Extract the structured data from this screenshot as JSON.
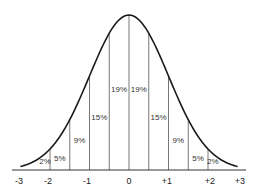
{
  "chart_data": {
    "type": "area",
    "title": "",
    "xlabel": "",
    "ylabel": "",
    "x_ticks": [
      "-3",
      "-2",
      "-1",
      "0",
      "+1",
      "+2",
      "+3"
    ],
    "xlim": [
      -3,
      3
    ],
    "grid": false,
    "legend": null,
    "bands": [
      {
        "from": -2.5,
        "to": -2.0,
        "percent": "2%"
      },
      {
        "from": -2.0,
        "to": -1.5,
        "percent": "5%"
      },
      {
        "from": -1.5,
        "to": -1.0,
        "percent": "9%"
      },
      {
        "from": -1.0,
        "to": -0.5,
        "percent": "15%"
      },
      {
        "from": -0.5,
        "to": 0.0,
        "percent": "19%"
      },
      {
        "from": 0.0,
        "to": 0.5,
        "percent": "19%"
      },
      {
        "from": 0.5,
        "to": 1.0,
        "percent": "15%"
      },
      {
        "from": 1.0,
        "to": 1.5,
        "percent": "9%"
      },
      {
        "from": 1.5,
        "to": 2.0,
        "percent": "5%"
      },
      {
        "from": 2.0,
        "to": 2.5,
        "percent": "2%"
      }
    ],
    "curve_color": "#1a1a1a",
    "divider_color": "#555555"
  }
}
